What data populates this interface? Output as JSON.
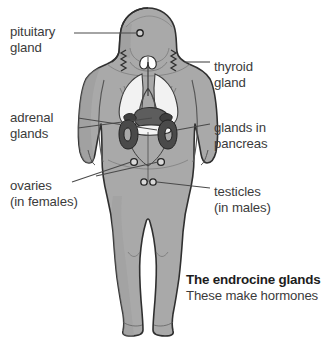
{
  "diagram": {
    "title": "The endrocine glands",
    "subtitle": "These make hormones",
    "colors": {
      "background": "#ffffff",
      "body_fill": "#a9a9a9",
      "body_shade": "#949494",
      "body_outline": "#2f2f2f",
      "organ_dark": "#4a4a4a",
      "organ_mid": "#6e6e6e",
      "organ_light": "#e9e9e9",
      "leader_line": "#4a4a4a",
      "label_text": "#3b3b3b",
      "caption_text": "#1d1d1d"
    },
    "labels": [
      {
        "id": "pituitary-gland",
        "side": "left",
        "line1": "pituitary",
        "line2": "gland",
        "x": 10,
        "y": 24
      },
      {
        "id": "adrenal-glands",
        "side": "left",
        "line1": "adrenal",
        "line2": "glands",
        "x": 10,
        "y": 110
      },
      {
        "id": "ovaries",
        "side": "left",
        "line1": "ovaries",
        "line2": "(in females)",
        "x": 10,
        "y": 178
      },
      {
        "id": "thyroid-gland",
        "side": "right",
        "line1": "thyroid",
        "line2": "gland",
        "x": 214,
        "y": 59
      },
      {
        "id": "glands-in-pancreas",
        "side": "right",
        "line1": "glands in",
        "line2": "pancreas",
        "x": 214,
        "y": 120
      },
      {
        "id": "testicles",
        "side": "right",
        "line1": "testicles",
        "line2": "(in males)",
        "x": 214,
        "y": 184
      }
    ],
    "organs": [
      {
        "id": "pituitary-gland",
        "marker": "dot",
        "cx": 140,
        "cy": 33
      },
      {
        "id": "thyroid-gland",
        "marker": "butterfly",
        "cx": 148,
        "cy": 62
      },
      {
        "id": "lungs",
        "marker": "lungs",
        "cx": 148,
        "cy": 88
      },
      {
        "id": "adrenal-gland-left",
        "marker": "blob",
        "cx": 132,
        "cy": 122
      },
      {
        "id": "adrenal-gland-right",
        "marker": "blob",
        "cx": 166,
        "cy": 122
      },
      {
        "id": "kidney-left",
        "marker": "kidney",
        "cx": 128,
        "cy": 134
      },
      {
        "id": "kidney-right",
        "marker": "kidney",
        "cx": 170,
        "cy": 134
      },
      {
        "id": "pancreas",
        "marker": "strip",
        "cx": 150,
        "cy": 130
      },
      {
        "id": "ovary-left",
        "marker": "dot",
        "cx": 134,
        "cy": 162
      },
      {
        "id": "ovary-right",
        "marker": "dot",
        "cx": 161,
        "cy": 162
      },
      {
        "id": "testicle-left",
        "marker": "dot",
        "cx": 144,
        "cy": 182
      },
      {
        "id": "testicle-right",
        "marker": "dot",
        "cx": 153,
        "cy": 182
      }
    ]
  }
}
